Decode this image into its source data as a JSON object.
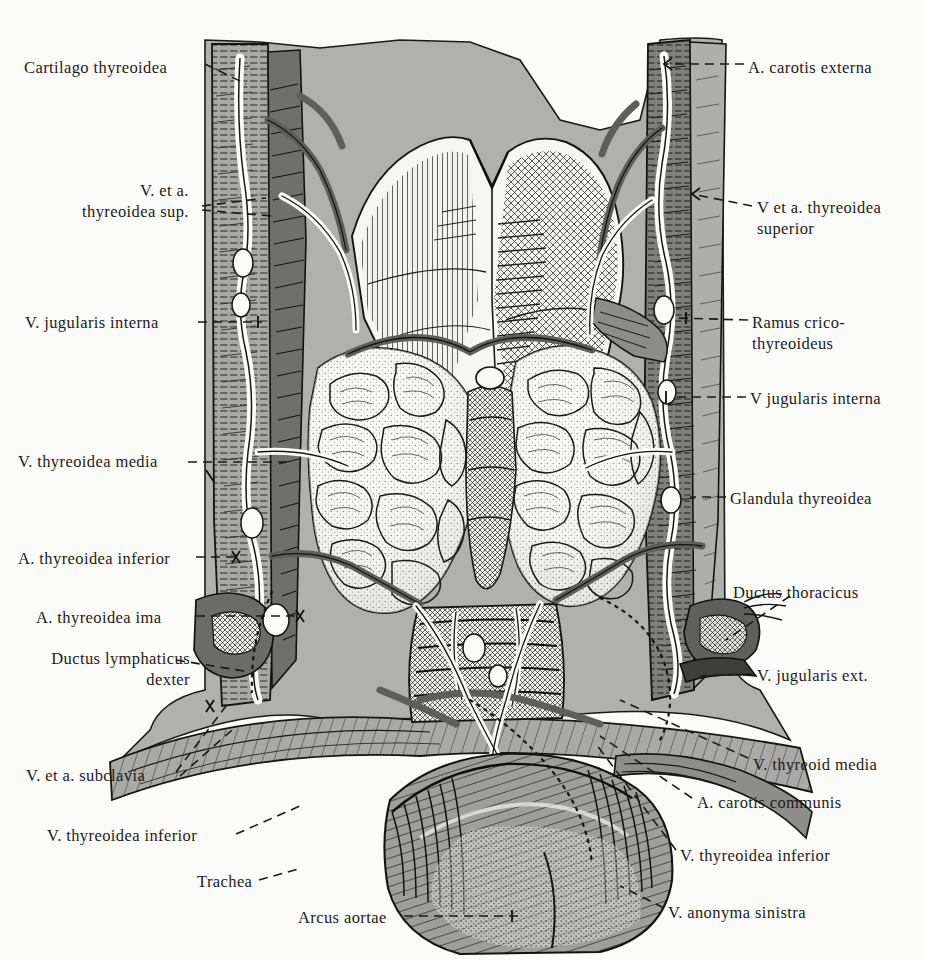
{
  "figure": {
    "kind": "anatomical-engraving",
    "style": "monochrome halftone lithograph",
    "top_cropped_caption": "· · · ·",
    "palette": {
      "background": "#fbfbf9",
      "ink": "#1b1b1b",
      "muscle_light": "#b2b2b0",
      "muscle_mid": "#9a9a98",
      "vessel_dark": "#6e6e6c",
      "shadow_dark": "#4a4a48",
      "highlight": "#f2f2ee"
    }
  },
  "labels": {
    "left": [
      {
        "id": "cartilago-thyreoidea",
        "text": "Cartilago thyreoidea",
        "x": 24,
        "y": 58,
        "leader": "dashed"
      },
      {
        "id": "v-et-a-thyreoidea-sup",
        "text": "V. et a.\nthyreoidea sup.",
        "x": 82,
        "y": 180,
        "leader": "dashed-fork"
      },
      {
        "id": "v-jugularis-interna-left",
        "text": "V. jugularis interna",
        "x": 25,
        "y": 313,
        "leader": "dashed"
      },
      {
        "id": "v-thyreoidea-media-left",
        "text": "V. thyreoidea media",
        "x": 18,
        "y": 452,
        "leader": "dashed"
      },
      {
        "id": "a-thyreoidea-inferior",
        "text": "A. thyreoidea inferior",
        "x": 18,
        "y": 549,
        "leader": "dashed"
      },
      {
        "id": "a-thyreoidea-ima",
        "text": "A. thyreoidea ima",
        "x": 36,
        "y": 608,
        "leader": "dashed"
      },
      {
        "id": "ductus-lymphaticus-dexter",
        "text": "Ductus lymphaticus\ndexter",
        "x": 10,
        "y": 648,
        "leader": "dashed"
      },
      {
        "id": "v-et-a-subclavia",
        "text": "V. et a. subclavia",
        "x": 26,
        "y": 766,
        "leader": "dashed-fork"
      },
      {
        "id": "v-thyreoidea-inferior-left",
        "text": "V. thyreoidea inferior",
        "x": 47,
        "y": 826,
        "leader": "dashed"
      },
      {
        "id": "trachea",
        "text": "Trachea",
        "x": 197,
        "y": 872,
        "leader": "dashed"
      },
      {
        "id": "arcus-aortae",
        "text": "Arcus aortae",
        "x": 298,
        "y": 908,
        "leader": "dashed-cross"
      }
    ],
    "right": [
      {
        "id": "a-carotis-externa",
        "text": "A. carotis externa",
        "x": 748,
        "y": 58,
        "leader": "dashed-arrow"
      },
      {
        "id": "v-et-a-thyreoidea-superior",
        "text": "V et a. thyreoidea\n      superior",
        "x": 757,
        "y": 197,
        "leader": "dashed-arrow"
      },
      {
        "id": "ramus-crico-thyreoideus",
        "text": "Ramus crico-\n    thyreoideus",
        "x": 752,
        "y": 312,
        "leader": "dashed"
      },
      {
        "id": "v-jugularis-interna-right",
        "text": "V jugularis interna",
        "x": 750,
        "y": 389,
        "leader": "dashed"
      },
      {
        "id": "glandula-thyreoidea",
        "text": "Glandula thyreoidea",
        "x": 730,
        "y": 489,
        "leader": "dashed"
      },
      {
        "id": "ductus-thoracicus",
        "text": "Ductus  thoracicus",
        "x": 733,
        "y": 583,
        "leader": "dashed"
      },
      {
        "id": "v-jugularis-ext",
        "text": "V. jugularis ext.",
        "x": 757,
        "y": 666,
        "leader": "dashed"
      },
      {
        "id": "v-thyreoid-media-right",
        "text": "V. thyreoid media",
        "x": 753,
        "y": 755,
        "leader": "dashed"
      },
      {
        "id": "a-carotis-communis",
        "text": "A. carotis  communis",
        "x": 697,
        "y": 793,
        "leader": "dashed"
      },
      {
        "id": "v-thyreoidea-inferior-right",
        "text": "V. thyreoidea inferior",
        "x": 680,
        "y": 846,
        "leader": "dashed"
      },
      {
        "id": "v-anonyma-sinistra",
        "text": "V. anonyma sinistra",
        "x": 668,
        "y": 903,
        "leader": "dashed"
      }
    ]
  }
}
